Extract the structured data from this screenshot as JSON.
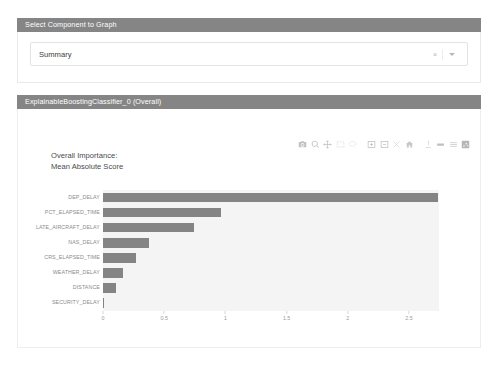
{
  "page": {
    "top_artifact": "·  ·   ·        ·            ·                   ·"
  },
  "select_panel": {
    "header": "Select Component to Graph",
    "selected_value": "Summary",
    "clear_icon": "×",
    "caret_icon": "chevron-down-icon"
  },
  "chart_panel": {
    "header": "ExplainableBoostingClassifier_0 (Overall)",
    "title_line1": "Overall Importance:",
    "title_line2": "Mean Absolute Score",
    "modebar": [
      {
        "name": "download-camera-icon",
        "title": "Download plot as a png"
      },
      {
        "name": "zoom-icon",
        "title": "Zoom"
      },
      {
        "name": "pan-icon",
        "title": "Pan"
      },
      {
        "name": "box-select-icon",
        "title": "Box Select"
      },
      {
        "name": "lasso-select-icon",
        "title": "Lasso Select"
      },
      {
        "name": "zoom-in-icon",
        "title": "Zoom in"
      },
      {
        "name": "zoom-out-icon",
        "title": "Zoom out"
      },
      {
        "name": "autoscale-icon",
        "title": "Autoscale"
      },
      {
        "name": "reset-axes-icon",
        "title": "Reset axes"
      },
      {
        "name": "toggle-spikelines-icon",
        "title": "Toggle Spike Lines"
      },
      {
        "name": "hover-compare-icon",
        "title": "Show closest data on hover"
      },
      {
        "name": "hover-closest-icon",
        "title": "Compare data on hover"
      },
      {
        "name": "plotly-logo-icon",
        "title": "Produced with Plotly"
      }
    ]
  },
  "chart_data": {
    "type": "bar",
    "orientation": "horizontal",
    "title": "Overall Importance: Mean Absolute Score",
    "xlabel": "",
    "ylabel": "",
    "categories": [
      "DEP_DELAY",
      "PCT_ELAPSED_TIME",
      "LATE_AIRCRAFT_DELAY",
      "NAS_DELAY",
      "CRS_ELAPSED_TIME",
      "WEATHER_DELAY",
      "DISTANCE",
      "SECURITY_DELAY"
    ],
    "values": [
      2.74,
      0.96,
      0.74,
      0.375,
      0.27,
      0.165,
      0.105,
      0.005
    ],
    "xlim": [
      0,
      2.745
    ],
    "xticks": [
      0,
      0.5,
      1,
      1.5,
      2,
      2.5
    ],
    "xtick_labels": [
      "0",
      "0.5",
      "1",
      "1.5",
      "2",
      "2.5"
    ],
    "grid": false,
    "legend": false,
    "bar_color": "#848484",
    "plot_bgcolor": "#f4f4f4"
  },
  "colors": {
    "header_band": "#858585",
    "bar": "#848484",
    "plot_bg": "#f4f4f4",
    "card_border": "#ededed"
  }
}
